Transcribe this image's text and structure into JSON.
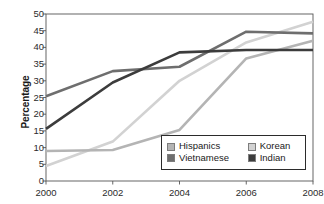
{
  "chart_data": {
    "type": "line",
    "title": "",
    "subtitle": "",
    "xlabel": "",
    "ylabel": "Percentage",
    "x": [
      2000,
      2002,
      2004,
      2006,
      2008
    ],
    "xtick_labels": [
      "2000",
      "2002",
      "2004",
      "2006",
      "2008"
    ],
    "ytick_labels": [
      "0",
      "5",
      "10",
      "15",
      "20",
      "25",
      "30",
      "35",
      "40",
      "45",
      "50"
    ],
    "ytick_values": [
      0,
      5,
      10,
      15,
      20,
      25,
      30,
      35,
      40,
      45,
      50
    ],
    "ylim": [
      0,
      50
    ],
    "xlim": [
      2000,
      2008
    ],
    "grid": false,
    "legend_position": "lower-right",
    "series": [
      {
        "name": "Hispanics",
        "color": "#b4b4b4",
        "values": [
          9.0,
          9.3,
          15.3,
          36.7,
          42.0
        ]
      },
      {
        "name": "Korean",
        "color": "#d2d2d2",
        "values": [
          4.5,
          11.8,
          30.0,
          41.5,
          47.7
        ]
      },
      {
        "name": "Vietnamese",
        "color": "#6e6e6e",
        "values": [
          25.4,
          32.9,
          34.2,
          44.7,
          44.2
        ]
      },
      {
        "name": "Indian",
        "color": "#3c3c3c",
        "values": [
          15.6,
          29.5,
          38.5,
          39.2,
          39.2
        ]
      }
    ]
  },
  "legend": {
    "entries": [
      {
        "label": "Hispanics",
        "color": "#b4b4b4"
      },
      {
        "label": "Korean",
        "color": "#d2d2d2"
      },
      {
        "label": "Vietnamese",
        "color": "#6e6e6e"
      },
      {
        "label": "Indian",
        "color": "#3c3c3c"
      }
    ]
  },
  "axis": {
    "y_title": "Percentage",
    "axis_color": "#555555"
  }
}
